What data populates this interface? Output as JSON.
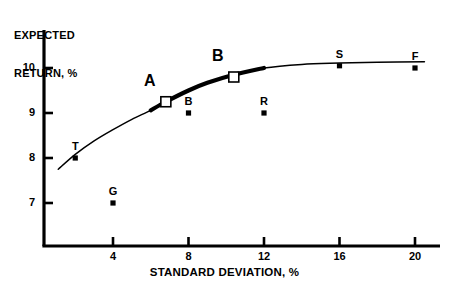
{
  "chart_data": {
    "type": "scatter",
    "title": "",
    "xlabel": "STANDARD DEVIATION, %",
    "ylabel_line1": "EXPECTED",
    "ylabel_line2": "RETURN, %",
    "xlim": [
      0.0,
      21.5
    ],
    "ylim": [
      5.9,
      10.6
    ],
    "xticks": [
      4,
      8,
      12,
      16,
      20
    ],
    "xtick_labels": [
      "4",
      "8",
      "12",
      "16",
      "20"
    ],
    "yticks": [
      7,
      8,
      9,
      10
    ],
    "ytick_labels": [
      "7",
      "8",
      "9",
      "10"
    ],
    "grid": false,
    "legend": "none",
    "series": [
      {
        "name": "individual-assets",
        "marker": "filled-square",
        "points": [
          {
            "label": "T",
            "x": 2.0,
            "y": 8.0
          },
          {
            "label": "G",
            "x": 4.0,
            "y": 7.0
          },
          {
            "label": "B",
            "x": 8.0,
            "y": 9.0
          },
          {
            "label": "R",
            "x": 12.0,
            "y": 9.0
          },
          {
            "label": "S",
            "x": 16.0,
            "y": 10.05
          },
          {
            "label": "F",
            "x": 20.0,
            "y": 10.0
          }
        ]
      },
      {
        "name": "portfolios",
        "marker": "open-square",
        "points": [
          {
            "label": "A",
            "x": 6.8,
            "y": 9.25
          },
          {
            "label": "B",
            "x": 10.4,
            "y": 9.8
          }
        ]
      }
    ],
    "curve": {
      "name": "efficient-frontier",
      "points": [
        {
          "x": 1.1,
          "y": 7.75
        },
        {
          "x": 2.0,
          "y": 8.08
        },
        {
          "x": 3.0,
          "y": 8.38
        },
        {
          "x": 4.0,
          "y": 8.63
        },
        {
          "x": 5.0,
          "y": 8.86
        },
        {
          "x": 6.0,
          "y": 9.06
        },
        {
          "x": 6.8,
          "y": 9.25
        },
        {
          "x": 8.0,
          "y": 9.5
        },
        {
          "x": 9.0,
          "y": 9.67
        },
        {
          "x": 10.4,
          "y": 9.85
        },
        {
          "x": 12.0,
          "y": 10.0
        },
        {
          "x": 14.0,
          "y": 10.08
        },
        {
          "x": 16.0,
          "y": 10.11
        },
        {
          "x": 18.0,
          "y": 10.13
        },
        {
          "x": 20.5,
          "y": 10.14
        }
      ],
      "thick_segment": [
        6.0,
        11.5
      ]
    },
    "colors": {
      "axis": "#000000",
      "marker": "#000000",
      "curve": "#000000",
      "background": "#ffffff"
    }
  }
}
